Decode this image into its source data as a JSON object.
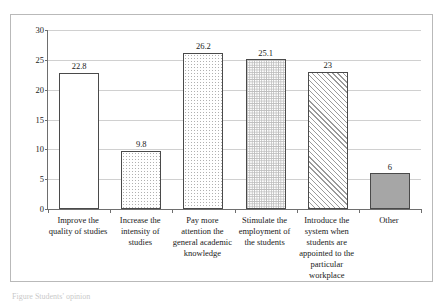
{
  "chart_data": {
    "type": "bar",
    "title": "",
    "subtitle": "",
    "xlabel": "",
    "ylabel": "",
    "ylim": [
      0,
      30
    ],
    "ytick_step": 5,
    "ytick_labels": [
      "0",
      "5",
      "10",
      "15",
      "20",
      "25",
      "30"
    ],
    "grid": true,
    "legend": "none",
    "categories": [
      "Improve the quality of studies",
      "Increase the intensity of studies",
      "Pay more attention the general academic knowledge",
      "Stimulate the employment of the students",
      "Introduce the system when students are appointed to the particular workplace",
      "Other"
    ],
    "values": [
      22.8,
      9.8,
      26.2,
      25.1,
      23,
      6
    ],
    "value_labels": [
      "22.8",
      "9.8",
      "26.2",
      "25.1",
      "23",
      "6"
    ],
    "bar_fills": [
      "none",
      "dots",
      "dots",
      "grid",
      "diag",
      "solid"
    ],
    "bar_border_color": "#4a4a4a",
    "axis_color": "#6e6e6e",
    "grid_color": "#d0d0d0",
    "frame_color": "#b9b9b9",
    "solid_fill_color": "#a6a6a6",
    "background": "#ffffff"
  },
  "caption": {
    "text": "Figure    Students' opinion"
  }
}
